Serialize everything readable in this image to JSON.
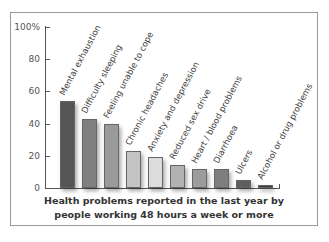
{
  "chart_data": {
    "type": "bar",
    "title": "Health problems reported in the last year by people working 48 hours a week or more",
    "xlabel": "",
    "ylabel": "",
    "ylim": [
      0,
      100
    ],
    "yticks": [
      "0",
      "20",
      "40",
      "60",
      "80",
      "100%"
    ],
    "grid": false,
    "legend": null,
    "categories": [
      "Mental exhaustion",
      "Difficulty sleeping",
      "Feeling unable to cope",
      "Chronic headaches",
      "Anxiety and depression",
      "Reduced sex drive",
      "Heart / blood problems",
      "Diarrhoea",
      "Ulcers",
      "Alcohol or drug problems"
    ],
    "values": [
      54,
      43,
      40,
      23,
      19,
      14,
      12,
      12,
      5,
      2
    ],
    "colors": [
      "#555555",
      "#808080",
      "#9a9a9a",
      "#c4c4c4",
      "#dcdcdc",
      "#b2b2b2",
      "#9c9c9c",
      "#7e7e7e",
      "#5e5e5e",
      "#3a3a3a"
    ]
  },
  "caption": {
    "line1": "Health problems reported in the last year by",
    "line2": "people working 48 hours a week or more"
  }
}
